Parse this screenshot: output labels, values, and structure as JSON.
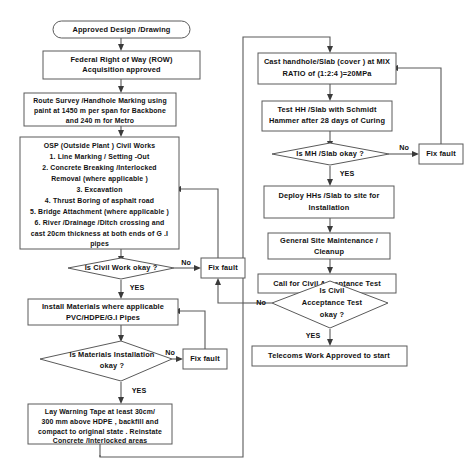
{
  "diagram": {
    "colors": {
      "stroke": "#5a5a5a",
      "text": "#111111",
      "background": "#ffffff",
      "arrow": "#3a3a3a"
    },
    "nodes": {
      "start": {
        "type": "terminator",
        "lines": [
          "Approved Design /Drawing"
        ]
      },
      "row_acquisition": {
        "type": "process",
        "lines": [
          "Federal Right of Way  (ROW)",
          "Acquisition approved"
        ]
      },
      "route_survey": {
        "type": "process",
        "lines": [
          "Route Survey /Handhole Marking using",
          "paint at  1450 m per span for Backbone",
          "and 240 m for Metro"
        ]
      },
      "osp_civil_works": {
        "type": "process",
        "lines": [
          "OSP (Outside Plant ) Civil Works",
          "1. Line Marking / Setting -Out",
          "2. Concrete Breaking /Interlocked",
          "Removal (where applicable )",
          "3. Excavation",
          "4. Thrust Boring of asphalt road",
          "5. Bridge Attachment (where applicable )",
          "6. River /Drainage /Ditch crossing and",
          "cast  20cm thickness at both ends of G  .I",
          "pipes"
        ]
      },
      "decision_civil_work": {
        "type": "decision",
        "lines": [
          "Is Civil Work okay  ?"
        ]
      },
      "fix_fault_civil_work": {
        "type": "process",
        "lines": [
          "Fix fault"
        ]
      },
      "install_materials": {
        "type": "process",
        "lines": [
          "Install Materials where applicable",
          "PVC/HDPE/G.I Pipes"
        ]
      },
      "decision_materials": {
        "type": "decision",
        "lines": [
          "Is Materials Installation",
          "okay ?"
        ]
      },
      "fix_fault_materials": {
        "type": "process",
        "lines": [
          "Fix fault"
        ]
      },
      "lay_warning_tape": {
        "type": "process",
        "lines": [
          "Lay Warning Tape at least    30cm/",
          "300 mm above HDPE , backfill and",
          "compact to original state  . Reinstate",
          "Concrete /Interlocked areas"
        ]
      },
      "cast_handhole": {
        "type": "process",
        "lines": [
          "Cast handhole/Slab (cover ) at MIX",
          "RATIO of  (1:2:4 )=20MPa"
        ]
      },
      "test_hh_slab": {
        "type": "process",
        "lines": [
          "Test HH /Slab with Schmidt",
          "Hammer after  28 days of Curing"
        ]
      },
      "decision_mh_slab": {
        "type": "decision",
        "lines": [
          "Is MH /Slab okay ?"
        ]
      },
      "fix_fault_mh_slab": {
        "type": "process",
        "lines": [
          "Fix fault"
        ]
      },
      "deploy_hhs": {
        "type": "process",
        "lines": [
          "Deploy HHs /Slab to site for",
          "Installation"
        ]
      },
      "general_site_maintenance": {
        "type": "process",
        "lines": [
          "General Site Maintenance  /",
          "Cleanup"
        ]
      },
      "call_acceptance_test": {
        "type": "process",
        "lines": [
          "Call for Civil Acceptance Test"
        ]
      },
      "decision_acceptance": {
        "type": "decision",
        "lines": [
          "Is Civil",
          "Acceptance Test",
          "okay ?"
        ]
      },
      "telecoms_approved": {
        "type": "process",
        "lines": [
          "Telecoms Work Approved to start"
        ]
      }
    },
    "edge_labels": {
      "civil_work_no": "No",
      "civil_work_yes": "YES",
      "materials_no": "No",
      "materials_yes": "YES",
      "mh_slab_no": "No",
      "mh_slab_yes": "YES",
      "acceptance_no": "No",
      "acceptance_yes": "YES"
    }
  }
}
